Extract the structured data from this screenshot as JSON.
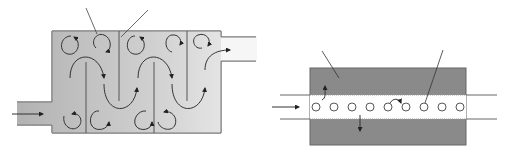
{
  "figure": {
    "width": 508,
    "height": 153,
    "background": "#ffffff",
    "labels": []
  },
  "colors": {
    "baffled_tank_fill_left": "#b4b4b4",
    "baffled_tank_fill_right": "#ececec",
    "tank_stroke": "#777777",
    "baffle_stroke": "#555555",
    "flow_arrow": "#333333",
    "leader_line": "#444444",
    "tubular_block_fill": "#8a8a8a",
    "tubular_block_stroke": "#666666",
    "channel_fill": "#ffffff",
    "particle_stroke": "#444444"
  },
  "left_diagram": {
    "name": "baffled-reactor",
    "tank": {
      "x": 52,
      "y": 31,
      "width": 169,
      "height": 102
    },
    "inlet_pipe": {
      "x1": 17,
      "y_top": 102,
      "y_bottom": 125,
      "arrow": {
        "x1": 12,
        "x2": 44,
        "y": 114
      }
    },
    "outlet_pipe": {
      "x2": 256,
      "y_top": 37,
      "y_bottom": 61
    },
    "baffles": [
      {
        "x": 86,
        "from": "bottom",
        "y1": 62,
        "y2": 133
      },
      {
        "x": 119,
        "from": "top",
        "y1": 31,
        "y2": 101
      },
      {
        "x": 154,
        "from": "bottom",
        "y1": 62,
        "y2": 133
      },
      {
        "x": 187,
        "from": "top",
        "y1": 31,
        "y2": 101
      }
    ],
    "leader_lines": [
      {
        "x1": 86,
        "y1": 8,
        "x2": 97,
        "y2": 34
      },
      {
        "x1": 148,
        "y1": 10,
        "x2": 121,
        "y2": 37
      }
    ]
  },
  "right_diagram": {
    "name": "tubular-reactor",
    "block": {
      "x": 310,
      "y": 68,
      "width": 156,
      "height": 77
    },
    "channel": {
      "y_top": 95,
      "y_bottom": 119,
      "x1": 280,
      "x2": 497
    },
    "inlet_arrow": {
      "x1": 272,
      "x2": 300,
      "y": 107
    },
    "particles": [
      316,
      334,
      352,
      370,
      388,
      406,
      424,
      442,
      460
    ],
    "particle_y": 107,
    "particle_r": 4,
    "leader_lines": [
      {
        "x1": 322,
        "y1": 51,
        "x2": 339,
        "y2": 78
      },
      {
        "x1": 443,
        "y1": 50,
        "x2": 424,
        "y2": 102
      }
    ]
  }
}
